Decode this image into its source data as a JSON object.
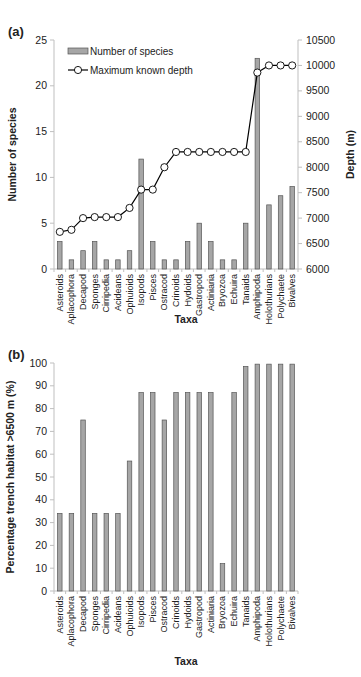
{
  "chart_data": [
    {
      "panel_label": "(a)",
      "type": "bar+line",
      "xlabel": "Taxa",
      "ylabel": "Number of species",
      "y2label": "Depth (m)",
      "ylim": [
        0,
        25
      ],
      "yticks": [
        0,
        5,
        10,
        15,
        20,
        25
      ],
      "y2lim": [
        6000,
        10500
      ],
      "y2ticks": [
        6000,
        6500,
        7000,
        7500,
        8000,
        8500,
        9000,
        9500,
        10000,
        10500
      ],
      "grid": false,
      "legend_position": "upper left",
      "categories": [
        "Asteroids",
        "Aplacophora",
        "Decapod",
        "Sponges",
        "Cirripedia",
        "Acideans",
        "Ophuioids",
        "Isopods",
        "Pisces",
        "Ostracod",
        "Crinoids",
        "Hydoids",
        "Gastropod",
        "Actiniaria",
        "Bryozoa",
        "Echuira",
        "Tanaids",
        "Amphipoda",
        "Holothurians",
        "Polychaete",
        "Bivalves"
      ],
      "series": [
        {
          "name": "Number of species",
          "type": "bar",
          "axis": "left",
          "color": "#a6a6a6",
          "values": [
            3,
            1,
            2,
            3,
            1,
            1,
            2,
            12,
            3,
            1,
            1,
            3,
            5,
            3,
            1,
            1,
            5,
            23,
            7,
            8,
            9
          ]
        },
        {
          "name": "Maximum known depth",
          "type": "line",
          "axis": "right",
          "marker": "open-circle",
          "color": "#000000",
          "values": [
            6730,
            6770,
            7000,
            7020,
            7020,
            7020,
            7200,
            7560,
            7560,
            8000,
            8300,
            8300,
            8300,
            8300,
            8300,
            8300,
            8300,
            9860,
            10000,
            10000,
            10000
          ]
        }
      ]
    },
    {
      "panel_label": "(b)",
      "type": "bar",
      "xlabel": "Taxa",
      "ylabel": "Percentage trench habitat >6500 m (%)",
      "ylim": [
        0,
        100
      ],
      "yticks": [
        0,
        10,
        20,
        30,
        40,
        50,
        60,
        70,
        80,
        90,
        100
      ],
      "grid": false,
      "categories": [
        "Asteroids",
        "Aplacophora",
        "Decapod",
        "Sponges",
        "Cirripedia",
        "Acideans",
        "Ophuioids",
        "Isopods",
        "Pisces",
        "Ostracod",
        "Crinoids",
        "Hydoids",
        "Gastropod",
        "Actiniaria",
        "Bryozoa",
        "Echuira",
        "Tanaids",
        "Amphipoda",
        "Holothurians",
        "Polychaete",
        "Bivalves"
      ],
      "series": [
        {
          "name": "Percentage trench habitat >6500 m",
          "color": "#a6a6a6",
          "values": [
            34,
            34,
            75,
            34,
            34,
            34,
            57,
            87,
            87,
            75,
            87,
            87,
            87,
            87,
            12,
            87,
            98.5,
            99.5,
            99.5,
            99.5,
            99.5
          ]
        }
      ]
    }
  ]
}
